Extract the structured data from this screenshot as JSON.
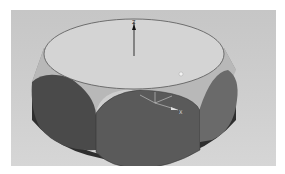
{
  "scene": {
    "description": "3D CAD model: cylindrical ring with scalloped elliptical faces",
    "background_color": "#cbcbcb",
    "top_face_color": "#d2d2d2",
    "side_face_color": "#5a5a5a",
    "dark_face_color": "#3a3a3a",
    "chamfer_color": "#8a8a8a",
    "axes": {
      "z_label": "Z",
      "x_label": "X"
    }
  }
}
